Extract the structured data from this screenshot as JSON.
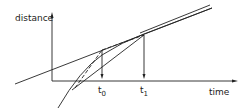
{
  "diagram": {
    "y_axis_label": "distance",
    "x_axis_label": "time",
    "markers": [
      {
        "label": "t",
        "subscript": "0"
      },
      {
        "label": "t",
        "subscript": "1"
      }
    ],
    "line_color": "#222222",
    "background": "#ffffff"
  }
}
